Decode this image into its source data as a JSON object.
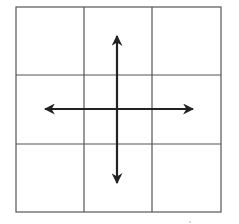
{
  "diagram": {
    "type": "grid-with-directional-arrows",
    "grid": {
      "rows": 3,
      "cols": 3,
      "left": 16,
      "top": 7,
      "right": 221,
      "bottom": 212,
      "vertical_lines": [
        84,
        152
      ],
      "horizontal_lines": [
        75,
        144
      ],
      "line_color": "#555555"
    },
    "arrows": {
      "center": [
        117,
        109
      ],
      "color": "#222222",
      "items": [
        {
          "direction": "up",
          "tip": [
            117,
            36
          ]
        },
        {
          "direction": "down",
          "tip": [
            117,
            183
          ]
        },
        {
          "direction": "left",
          "tip": [
            45,
            109
          ]
        },
        {
          "direction": "right",
          "tip": [
            193,
            109
          ]
        }
      ]
    }
  }
}
